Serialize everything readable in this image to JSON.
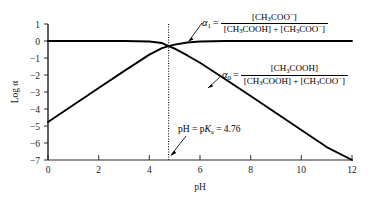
{
  "chart_data": {
    "type": "line",
    "title": "",
    "xlabel": "pH",
    "ylabel": "Log α",
    "xlim": [
      0,
      12
    ],
    "ylim": [
      -7,
      1
    ],
    "xticks": [
      0,
      2,
      4,
      6,
      8,
      10,
      12
    ],
    "yticks": [
      1,
      0,
      -1,
      -2,
      -3,
      -4,
      -5,
      -6,
      -7
    ],
    "grid": false,
    "legend": "none",
    "pKa": 4.76,
    "series": [
      {
        "name": "alpha_1",
        "label": "α₁",
        "description": "Log alpha-1 = log([CH3COO-] / ([CH3COOH] + [CH3COO-]))",
        "x": [
          0,
          1,
          2,
          3,
          4,
          4.5,
          4.76,
          5,
          5.5,
          6,
          7,
          8,
          9,
          10,
          11,
          12
        ],
        "y": [
          -4.76,
          -3.76,
          -2.76,
          -1.77,
          -0.8,
          -0.42,
          -0.3,
          -0.21,
          -0.09,
          -0.03,
          -0.003,
          0.0,
          0.0,
          0.0,
          0.0,
          0.0
        ]
      },
      {
        "name": "alpha_0",
        "label": "α₀",
        "description": "Log alpha-0 = log([CH3COOH] / ([CH3COOH] + [CH3COO-]))",
        "x": [
          0,
          1,
          2,
          3,
          4,
          4.5,
          4.76,
          5,
          5.5,
          6,
          7,
          8,
          9,
          10,
          11,
          12
        ],
        "y": [
          0.0,
          0.0,
          0.0,
          -0.003,
          -0.03,
          -0.12,
          -0.3,
          -0.45,
          -0.85,
          -1.28,
          -2.25,
          -3.24,
          -4.24,
          -5.24,
          -6.24,
          -7.0
        ]
      }
    ],
    "annotations": [
      {
        "name": "alpha1-definition",
        "symbol": "α",
        "subscript": "1",
        "equals": "=",
        "numerator": "[CH₃COO⁻]",
        "denominator": "[CH₃COOH] + [CH₃COO⁻]",
        "points_to_series": "alpha_1"
      },
      {
        "name": "alpha0-definition",
        "symbol": "α",
        "subscript": "0",
        "equals": "=",
        "numerator": "[CH₃COOH]",
        "denominator": "[CH₃COOH] + [CH₃COO⁻]",
        "points_to_series": "alpha_0"
      },
      {
        "name": "pka-marker",
        "text": "pH = pKa = 4.76",
        "value": 4.76,
        "style": "vertical dotted line"
      }
    ]
  },
  "axes": {
    "y_label": "Log α",
    "x_label": "pH",
    "y_tick_labels": [
      "1",
      "0",
      "−1",
      "−2",
      "−3",
      "−4",
      "−5",
      "−6",
      "−7"
    ],
    "x_tick_labels": [
      "0",
      "2",
      "4",
      "6",
      "8",
      "10",
      "12"
    ]
  },
  "annotations": {
    "alpha1": {
      "symbol": "α",
      "subscript": "1",
      "equals": "=",
      "numerator_prefix": "[CH",
      "numerator_sub": "3",
      "numerator_mid": "COO",
      "numerator_sup": "−",
      "numerator_suffix": "]"
    },
    "alpha0": {
      "symbol": "α",
      "subscript": "0",
      "equals": "="
    },
    "pka": {
      "prefix": "pH = p",
      "k": "K",
      "sub": "a",
      "suffix": " = 4.76"
    }
  },
  "colors": {
    "curve": "#000000",
    "axis": "#2a2a2a",
    "background": "#ffffff",
    "text": "#000000"
  }
}
